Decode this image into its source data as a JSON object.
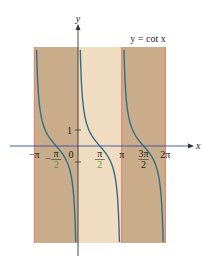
{
  "chart_data": {
    "type": "line",
    "title": "y = cot x",
    "function": "cot",
    "xlabel": "x",
    "ylabel": "y",
    "xlim": [
      -3.1416,
      6.2832
    ],
    "ylim": [
      -6,
      6
    ],
    "grid": false,
    "series": [
      {
        "name": "y = cot x",
        "color": "#2f6f86",
        "branches": [
          [
            -3.1416,
            0
          ],
          [
            0,
            3.1416
          ],
          [
            3.1416,
            6.2832
          ]
        ]
      }
    ],
    "bands": [
      {
        "from": -3.1416,
        "to": 0,
        "color": "#c9ad8a"
      },
      {
        "from": 0,
        "to": 3.1416,
        "color": "#f0dcc0"
      },
      {
        "from": 3.1416,
        "to": 6.2832,
        "color": "#c9ad8a"
      }
    ],
    "asymptotes": [
      -3.1416,
      0,
      3.1416,
      6.2832
    ],
    "asymptote_color": "#e07a6a",
    "x_ticks": [
      {
        "value": -3.1416,
        "label": "−π",
        "color": "#1a1a1a"
      },
      {
        "value": -1.5708,
        "label_num": "π",
        "label_den": "2",
        "sign": "−",
        "color": "#5a9a3a"
      },
      {
        "value": 0,
        "label": "0",
        "color": "#1a1a1a"
      },
      {
        "value": 1.5708,
        "label_num": "π",
        "label_den": "2",
        "sign": "",
        "color": "#5a9a3a"
      },
      {
        "value": 3.1416,
        "label": "π",
        "color": "#1a1a1a"
      },
      {
        "value": 4.7124,
        "label_num": "3π",
        "label_den": "2",
        "sign": "",
        "color": "#1a1a1a"
      },
      {
        "value": 6.2832,
        "label": "2π",
        "color": "#1a1a1a"
      }
    ],
    "y_ticks": [
      {
        "value": 1,
        "label": "1"
      },
      {
        "value": -1,
        "label": ""
      }
    ],
    "legend": "top-right",
    "axis_color": "#3a4aa0"
  }
}
